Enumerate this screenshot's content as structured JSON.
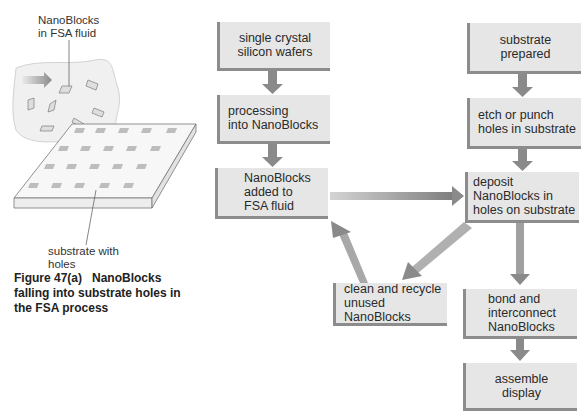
{
  "illustration": {
    "label_top": [
      "NanoBlocks",
      "in FSA fluid"
    ],
    "label_bottom": [
      "substrate with",
      "holes"
    ]
  },
  "caption": {
    "line1": "Figure 47(a)   NanoBlocks",
    "line2": "falling into substrate holes in",
    "line3": "the FSA process"
  },
  "flow": {
    "wafers": [
      "single crystal",
      "silicon wafers"
    ],
    "processing": [
      "processing",
      "into NanoBlocks"
    ],
    "added": [
      "NanoBlocks",
      "added to",
      "FSA fluid"
    ],
    "substrate": [
      "substrate",
      "prepared"
    ],
    "etch": [
      "etch or punch",
      "holes in substrate"
    ],
    "deposit": [
      "deposit",
      "NanoBlocks in",
      "holes on substrate"
    ],
    "recycle": [
      "clean and recycle",
      "unused",
      "NanoBlocks"
    ],
    "bond": [
      "bond and",
      "interconnect",
      "NanoBlocks"
    ],
    "assemble": [
      "assemble",
      "display"
    ]
  },
  "colors": {
    "box_fill": "#e6e6e6",
    "box_edge": "#8c8c8c",
    "arrow": "#8a8a8a"
  }
}
